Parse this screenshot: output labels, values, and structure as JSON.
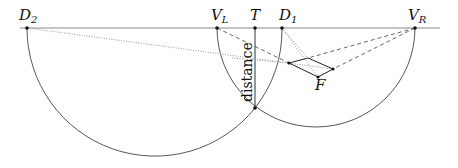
{
  "diagram": {
    "colors": {
      "horizon": "#8a8a8a",
      "arc": "#444444",
      "dashed": "#555555",
      "dotted": "#9a9a9a",
      "point": "#111111"
    },
    "labels": {
      "D2": {
        "main": "D",
        "sub": "2"
      },
      "VL": {
        "main": "V",
        "sub": "L"
      },
      "T": {
        "main": "T",
        "sub": ""
      },
      "D1": {
        "main": "D",
        "sub": "1"
      },
      "VR": {
        "main": "V",
        "sub": "R"
      },
      "F": {
        "main": "F",
        "sub": ""
      },
      "distance": "distance"
    },
    "points": {
      "D2": [
        27,
        28
      ],
      "VL": [
        217,
        28
      ],
      "T": [
        255,
        28
      ],
      "D1": [
        282,
        28
      ],
      "VR": [
        415,
        28
      ],
      "X": [
        255,
        108
      ],
      "Q1": [
        289,
        63
      ],
      "Q2": [
        308,
        58
      ],
      "Q3": [
        333,
        69
      ],
      "F": [
        318,
        77
      ]
    },
    "horizon": {
      "x1": 20,
      "x2": 440,
      "y": 28
    },
    "arcs": [
      {
        "name": "left-circle",
        "cx": 155,
        "cy": 28,
        "r": 128
      },
      {
        "name": "right-circle",
        "cx": 316,
        "cy": 28,
        "r": 99
      }
    ]
  }
}
